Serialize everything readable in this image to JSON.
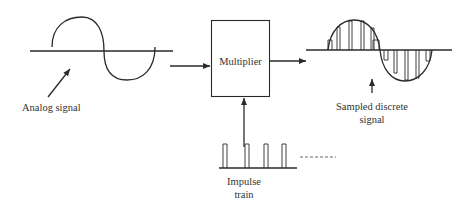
{
  "diagram": {
    "blocks": [
      {
        "id": "multiplier",
        "label": "Multiplier"
      }
    ],
    "labels": {
      "analog_signal": "Analog signal",
      "sampled_line1": "Sampled discrete",
      "sampled_line2": "signal",
      "impulse_line1": "Impulse",
      "impulse_line2": "train"
    },
    "flow": [
      {
        "from": "analog-signal",
        "to": "multiplier"
      },
      {
        "from": "impulse-train",
        "to": "multiplier"
      },
      {
        "from": "multiplier",
        "to": "sampled-discrete-signal"
      }
    ],
    "impulse_train": {
      "visible_pulses": 4,
      "continues": true
    },
    "colors": {
      "stroke": "#2a2a2a",
      "text": "#333333",
      "background": "#ffffff"
    }
  }
}
